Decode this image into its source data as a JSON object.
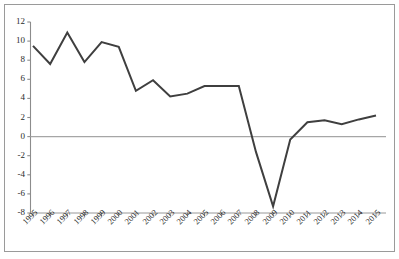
{
  "chart_data": {
    "type": "line",
    "title": "",
    "subtitle": "",
    "xlabel": "",
    "ylabel": "",
    "grid": false,
    "legend": null,
    "legend_position": "none",
    "line_color": "#3f3f3f",
    "zero_line_color": "#a6a6a6",
    "axis_color": "#8c8c8c",
    "frame_color": "#9a9a9a",
    "categories": [
      "1995",
      "1996",
      "1997",
      "1998",
      "1999",
      "2000",
      "2001",
      "2002",
      "2003",
      "2004",
      "2005",
      "2006",
      "2007",
      "2008",
      "2009",
      "2010",
      "2011",
      "2012",
      "2013",
      "2014",
      "2015"
    ],
    "values": [
      9.5,
      7.6,
      10.9,
      7.8,
      9.9,
      9.4,
      4.8,
      5.9,
      4.2,
      4.5,
      5.3,
      5.3,
      5.3,
      -1.6,
      -7.3,
      -0.3,
      1.5,
      1.7,
      1.3,
      1.8,
      2.2
    ],
    "ylim": [
      -8,
      12
    ],
    "ytick_values": [
      12,
      10,
      8,
      6,
      4,
      2,
      0,
      -2,
      -4,
      -6,
      -8
    ],
    "ytick_labels": [
      "12",
      "10",
      "8",
      "6",
      "4",
      "2",
      "0",
      "-2",
      "-4",
      "-6",
      "-8"
    ],
    "xlim": [
      "1995",
      "2015"
    ],
    "annotations": []
  }
}
